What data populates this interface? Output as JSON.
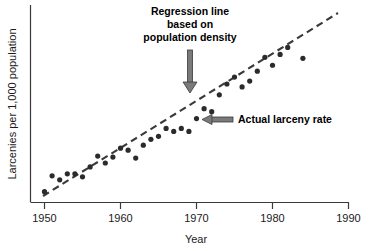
{
  "chart_data": {
    "type": "scatter",
    "title": "",
    "xlabel": "Year",
    "ylabel": "Larcenies per 1,000 population",
    "xlim": [
      1950,
      1990
    ],
    "ylim": [
      0,
      10
    ],
    "grid": false,
    "legend_position": "none",
    "x_ticks": [
      "1950",
      "1960",
      "1970",
      "1980",
      "1990"
    ],
    "x_tick_values": [
      1950,
      1960,
      1970,
      1980,
      1990
    ],
    "y_ticks": [],
    "series": [
      {
        "name": "Actual larceny rate",
        "type": "scatter",
        "marker": "filled-circle",
        "color": "#2b2b2b",
        "points": [
          {
            "x": 1950,
            "y": 0.55
          },
          {
            "x": 1951,
            "y": 1.35
          },
          {
            "x": 1952,
            "y": 1.15
          },
          {
            "x": 1953,
            "y": 1.45
          },
          {
            "x": 1954,
            "y": 1.45
          },
          {
            "x": 1955,
            "y": 1.3
          },
          {
            "x": 1956,
            "y": 1.8
          },
          {
            "x": 1957,
            "y": 2.35
          },
          {
            "x": 1958,
            "y": 2.0
          },
          {
            "x": 1959,
            "y": 2.3
          },
          {
            "x": 1960,
            "y": 2.75
          },
          {
            "x": 1961,
            "y": 2.65
          },
          {
            "x": 1962,
            "y": 2.25
          },
          {
            "x": 1963,
            "y": 2.9
          },
          {
            "x": 1964,
            "y": 3.2
          },
          {
            "x": 1965,
            "y": 3.35
          },
          {
            "x": 1966,
            "y": 3.75
          },
          {
            "x": 1967,
            "y": 3.6
          },
          {
            "x": 1968,
            "y": 3.75
          },
          {
            "x": 1969,
            "y": 3.6
          },
          {
            "x": 1970,
            "y": 4.25
          },
          {
            "x": 1971,
            "y": 4.75
          },
          {
            "x": 1972,
            "y": 4.6
          },
          {
            "x": 1973,
            "y": 5.45
          },
          {
            "x": 1974,
            "y": 6.0
          },
          {
            "x": 1975,
            "y": 6.35
          },
          {
            "x": 1976,
            "y": 5.85
          },
          {
            "x": 1977,
            "y": 6.15
          },
          {
            "x": 1978,
            "y": 6.65
          },
          {
            "x": 1979,
            "y": 7.35
          },
          {
            "x": 1980,
            "y": 6.95
          },
          {
            "x": 1981,
            "y": 7.5
          },
          {
            "x": 1982,
            "y": 7.85
          },
          {
            "x": 1984,
            "y": 7.3
          }
        ]
      },
      {
        "name": "Regression line based on population density",
        "type": "line",
        "style": "dashed",
        "color": "#3a3a3a",
        "endpoints": [
          {
            "x": 1950.5,
            "y": 0.85
          },
          {
            "x": 1984.5,
            "y": 8.15
          }
        ]
      }
    ],
    "annotations": [
      {
        "id": "regression-annotation",
        "lines": [
          "Regression line",
          "based on",
          "population density"
        ],
        "text": "Regression line based on population density",
        "arrow": "down",
        "target_x": 1967.5,
        "target_y": 4.1
      },
      {
        "id": "actual-rate-annotation",
        "lines": [
          "Actual larceny rate"
        ],
        "text": "Actual larceny rate",
        "arrow": "left",
        "target_x": 1969,
        "target_y": 3.6
      }
    ]
  },
  "axes": {
    "x_title": "Year",
    "y_title": "Larcenies per 1,000 population",
    "x_tick_labels": [
      "1950",
      "1960",
      "1970",
      "1980",
      "1990"
    ]
  },
  "annotations": {
    "regression": {
      "line1": "Regression line",
      "line2": "based on",
      "line3": "population density"
    },
    "actual": {
      "label": "Actual larceny rate"
    }
  }
}
